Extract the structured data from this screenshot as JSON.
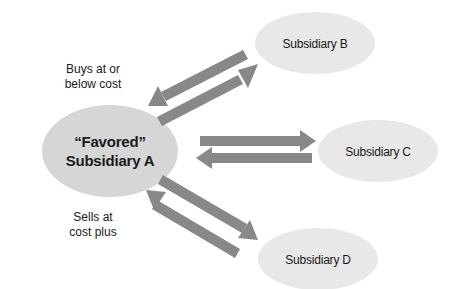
{
  "diagram": {
    "colors": {
      "ellipse_main": "#d6d6d6",
      "ellipse_sub": "#e8e8e8",
      "arrow": "#888888",
      "text": "#1a1a1a"
    },
    "nodes": {
      "a": {
        "line1": "“Favored”",
        "line2": "Subsidiary A"
      },
      "b": {
        "label": "Subsidiary B"
      },
      "c": {
        "label": "Subsidiary C"
      },
      "d": {
        "label": "Subsidiary D"
      }
    },
    "annotations": {
      "buys": {
        "line1": "Buys at or",
        "line2": "below cost"
      },
      "sells": {
        "line1": "Sells at",
        "line2": "cost plus"
      }
    },
    "edges": [
      {
        "from": "B",
        "to": "A",
        "direction": "to-A"
      },
      {
        "from": "A",
        "to": "B",
        "direction": "to-B"
      },
      {
        "from": "A",
        "to": "C",
        "direction": "to-C"
      },
      {
        "from": "C",
        "to": "A",
        "direction": "to-A"
      },
      {
        "from": "A",
        "to": "D",
        "direction": "to-D"
      },
      {
        "from": "D",
        "to": "A",
        "direction": "to-A"
      }
    ]
  }
}
